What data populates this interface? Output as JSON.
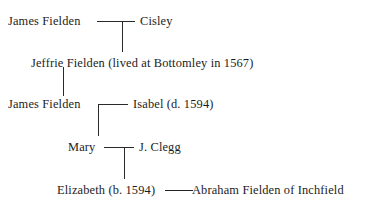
{
  "diagram": {
    "type": "family-tree",
    "generations": [
      {
        "id": "gen1",
        "left_person": "James Fielden",
        "union_marker": "——",
        "right_person": "Cisley"
      },
      {
        "id": "gen2",
        "left_person": "Jeffrie Fielden (lived at Bottomley in 1567)",
        "union_marker": "",
        "right_person": ""
      },
      {
        "id": "gen3",
        "left_person": "James Fielden",
        "union_marker": "——",
        "right_person": "Isabel (d. 1594)"
      },
      {
        "id": "gen4",
        "left_person": "Mary",
        "union_marker": "——",
        "right_person": "J. Clegg"
      },
      {
        "id": "gen5",
        "left_person": "Elizabeth (b. 1594)",
        "union_marker": "——",
        "right_person": "Abraham Fielden of Inchfield"
      }
    ],
    "colors": {
      "text": "#1c1c1c",
      "line": "#2a2a2a",
      "background": "#ffffff"
    }
  }
}
